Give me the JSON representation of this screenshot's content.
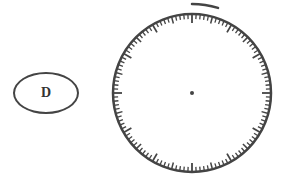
{
  "diagram": {
    "label": {
      "text": "D"
    },
    "dial": {
      "center": [
        192,
        93
      ],
      "radius": 79,
      "tick_count": 120,
      "major_every": 10,
      "mid_every": 5,
      "minor_len": 5,
      "mid_len": 7,
      "major_len": 9,
      "center_dot_radius": 2,
      "marker_arc": {
        "radius": 89,
        "start_deg": 0,
        "end_deg": 17
      },
      "stroke_color": "#444444"
    }
  }
}
